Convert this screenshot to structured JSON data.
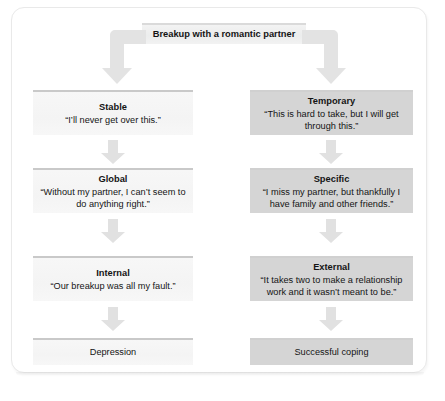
{
  "figure": {
    "title": "Breakup with a romantic partner",
    "branches": {
      "left_label": "pessimistic-attribution",
      "right_label": "optimistic-attribution"
    }
  },
  "nodes": {
    "root": {
      "text": "Breakup with a romantic partner"
    },
    "left": [
      {
        "title": "Stable",
        "quote": "“I’ll never get over this.”"
      },
      {
        "title": "Global",
        "quote": "“Without my partner, I can’t seem to do anything right.”"
      },
      {
        "title": "Internal",
        "quote": "“Our breakup was all my fault.”"
      }
    ],
    "right": [
      {
        "title": "Temporary",
        "quote": "“This is hard to take, but I will get through this.”"
      },
      {
        "title": "Specific",
        "quote": "“I miss my partner, but thankfully I have family and other friends.”"
      },
      {
        "title": "External",
        "quote": "“It takes two to make a relationship work and it wasn’t meant to be.”"
      }
    ],
    "outcomes": {
      "left": "Depression",
      "right": "Successful coping"
    }
  },
  "colors": {
    "light_box_fill": "#f5f5f5",
    "light_box_rule": "#c9c9c9",
    "dark_box_fill": "#d5d5d5",
    "header_fill": "#eceded",
    "arrow_fill": "#e0e0e0",
    "text": "#141414",
    "frame_border": "#e9e9e9"
  },
  "icons": {
    "elbow_left": "elbow-arrow-down-left-icon",
    "elbow_right": "elbow-arrow-down-right-icon",
    "down": "arrow-down-icon"
  }
}
